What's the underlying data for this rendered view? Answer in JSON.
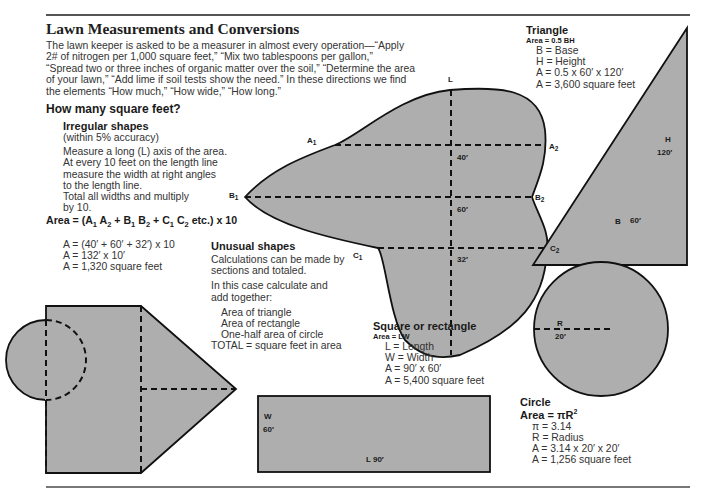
{
  "page": {
    "title": "Lawn Measurements and Conversions",
    "intro_lines": [
      "The lawn keeper is asked to be a measurer in almost every operation—“Apply",
      "2# of nitrogen per 1,000 square feet,” “Mix two tablespoons per gallon,”",
      "“Spread two or three inches of organic matter over the soil,” “Determine the area",
      "of your lawn,” “Add lime if soil tests show the need.” In these directions we find",
      "the elements “How much,” “How wide,” “How long.”"
    ],
    "section_heading": "How many square feet?"
  },
  "irregular": {
    "heading": "Irregular shapes",
    "subheading": "(within 5% accuracy)",
    "instructions": [
      "Measure a long (L) axis of the area.",
      "At every 10 feet on the length line",
      "measure the width at right angles",
      "to the length line.",
      "Total all widths and multiply",
      "by 10."
    ],
    "formula": {
      "prefix": "Area = (A",
      "parts": [
        "A",
        "B",
        "B",
        "C",
        "C"
      ],
      "suffix": "etc.) x 10"
    },
    "calc_lines": [
      "A = (40′ + 60′ + 32′) x 10",
      "A = 132′ x 10′",
      "A = 1,320 square feet"
    ],
    "diagram_labels": {
      "L": "L",
      "A1": "A",
      "A2": "A",
      "B1": "B",
      "B2": "B",
      "C1": "C",
      "C2": "C",
      "sub1": "1",
      "sub2": "2",
      "w_a": "40′",
      "w_b": "60′",
      "w_c": "32′"
    }
  },
  "unusual": {
    "heading": "Unusual shapes",
    "lines1": [
      "Calculations can be made by",
      "sections and totaled."
    ],
    "lines2": [
      "In this case calculate and",
      "add together:"
    ],
    "items": [
      "Area of triangle",
      "Area of rectangle",
      "One-half area of circle"
    ],
    "total": "TOTAL = square feet in area"
  },
  "triangle": {
    "heading": "Triangle",
    "formula": "Area = 0.5 BH",
    "lines": [
      "B = Base",
      "H = Height",
      "A = 0.5 x 60′ x 120′",
      "A = 3,600 square feet"
    ],
    "label_h": "H",
    "label_h_val": "120′",
    "label_b": "B",
    "label_b_val": "60′"
  },
  "rectangle": {
    "heading": "Square or rectangle",
    "formula": "Area = LW",
    "lines": [
      "L = Length",
      "W = Width",
      "A = 90′ x 60′",
      "A = 5,400 square feet"
    ],
    "label_w": "W",
    "label_w_val": "60′",
    "label_l": "L 90′"
  },
  "circle": {
    "heading": "Circle",
    "formula_prefix": "Area = πR",
    "formula_sup": "2",
    "lines": [
      "π = 3.14",
      "R = Radius",
      "A = 3.14 x 20′ x 20′",
      "A = 1,256 square feet"
    ],
    "label_r": "R",
    "label_r_val": "20′"
  },
  "colors": {
    "shape_fill": "#aeaeae",
    "outline": "#111111",
    "text": "#333333"
  }
}
